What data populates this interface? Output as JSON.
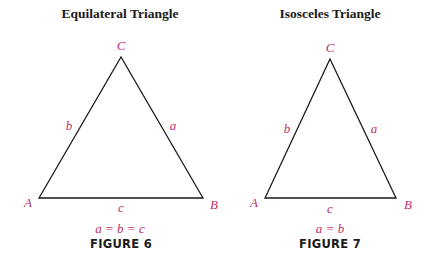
{
  "figures": [
    {
      "title": "Equilateral Triangle",
      "caption": "FIGURE 6",
      "equation": "a = b = c",
      "vertices": {
        "A": "A",
        "B": "B",
        "C": "C"
      },
      "sides": {
        "a": "a",
        "b": "b",
        "c": "c"
      },
      "geometry": {
        "A": [
          39,
          198
        ],
        "B": [
          203,
          198
        ],
        "C": [
          121,
          57
        ]
      }
    },
    {
      "title": "Isosceles Triangle",
      "caption": "FIGURE 7",
      "equation": "a = b",
      "vertices": {
        "A": "A",
        "B": "B",
        "C": "C"
      },
      "sides": {
        "a": "a",
        "b": "b",
        "c": "c"
      },
      "geometry": {
        "A": [
          265,
          198
        ],
        "B": [
          396,
          198
        ],
        "C": [
          330,
          59
        ]
      }
    }
  ],
  "colors": {
    "label": "#c0306a",
    "line": "#1a1a1a",
    "text": "#1a1a1a",
    "background": "#ffffff"
  }
}
